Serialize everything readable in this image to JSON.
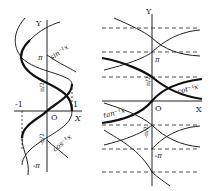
{
  "left_plot": {
    "title": "inverse sine and cosine",
    "axis_x_label": "X",
    "axis_y_label": "Y",
    "origin_label": "O",
    "tick_x": [
      "-1",
      "1"
    ],
    "tick_y": [
      "π",
      "π/2",
      "-π/2",
      "-π"
    ],
    "curve_labels": {
      "arcsin": "sin⁻¹x",
      "arccos": "cos⁻¹x"
    }
  },
  "right_plot": {
    "title": "inverse tangent and cotangent",
    "axis_x_label": "X",
    "axis_y_label": "Y",
    "origin_label": "O",
    "tick_y": [
      "π",
      "π/2",
      "-π/2",
      "-π"
    ],
    "curve_labels": {
      "arctan": "tan⁻¹x",
      "arccot": "cot⁻¹x"
    }
  },
  "colors": {
    "ink": "#222222",
    "background": "#ffffff"
  }
}
